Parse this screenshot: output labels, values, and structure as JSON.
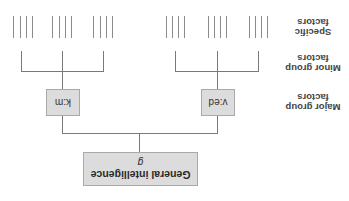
{
  "diagram": {
    "orientation": "rotated 180 degrees",
    "root": {
      "label": "General intelligence",
      "symbol": "g"
    },
    "major_factors": [
      {
        "label": "v:ed"
      },
      {
        "label": "k:m"
      }
    ],
    "level_labels": {
      "major": [
        "Major group",
        "factors"
      ],
      "minor": [
        "Minor group",
        "factors"
      ],
      "specific": [
        "Specific",
        "factors"
      ]
    },
    "minor_factor_count_per_major": 3,
    "specific_factor_count_per_minor": 4,
    "colors": {
      "box_fill": "#dcdcdc",
      "box_border": "#a9a9a9",
      "lines": "#7a7a7a"
    }
  }
}
